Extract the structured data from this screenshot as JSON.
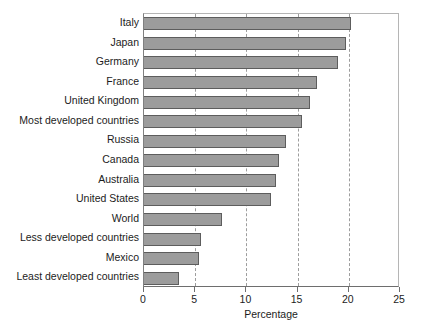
{
  "chart_data": {
    "type": "bar",
    "orientation": "horizontal",
    "title": "",
    "xlabel": "Percentage",
    "ylabel": "",
    "xlim": [
      0,
      25
    ],
    "xticks": [
      0,
      5,
      10,
      15,
      20,
      25
    ],
    "xtick_labels": [
      "0",
      "5",
      "10",
      "15",
      "20",
      "25"
    ],
    "grid": "vertical-dashed",
    "legend": "none",
    "bar_color": "#9c9c9c",
    "bar_edge_color": "#5d5d5d",
    "categories": [
      "Italy",
      "Japan",
      "Germany",
      "France",
      "United Kingdom",
      "Most developed countries",
      "Russia",
      "Canada",
      "Australia",
      "United States",
      "World",
      "Less developed countries",
      "Mexico",
      "Least developed countries"
    ],
    "values": [
      20.2,
      19.7,
      18.9,
      16.9,
      16.2,
      15.4,
      13.9,
      13.2,
      12.9,
      12.4,
      7.6,
      5.6,
      5.4,
      3.4
    ]
  }
}
